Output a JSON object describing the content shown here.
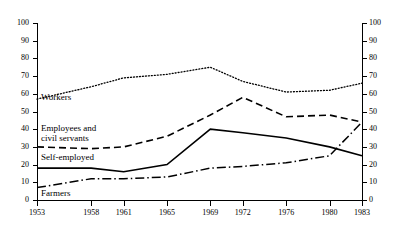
{
  "chart_data": {
    "type": "line",
    "title": "",
    "xlabel": "",
    "ylabel": "",
    "x": [
      1953,
      1958,
      1961,
      1965,
      1969,
      1972,
      1976,
      1980,
      1983
    ],
    "categories": [
      "1953",
      "1958",
      "1961",
      "1965",
      "1969",
      "1972",
      "1976",
      "1980",
      "1983"
    ],
    "xlim": [
      1953,
      1983
    ],
    "ylim": [
      0,
      100
    ],
    "ytick_step": 10,
    "yticks": [
      0,
      10,
      20,
      30,
      40,
      50,
      60,
      70,
      80,
      90,
      100
    ],
    "grid": false,
    "legend_position": "inline-left",
    "dual_y_axis": true,
    "series": [
      {
        "name": "Workers",
        "style": "dotted",
        "values": [
          57,
          64,
          69,
          71,
          75,
          67,
          61,
          62,
          66
        ]
      },
      {
        "name": "Employees and civil servants",
        "style": "dashed",
        "values": [
          30,
          29,
          30,
          36,
          48,
          58,
          47,
          48,
          44
        ]
      },
      {
        "name": "Self-employed",
        "style": "solid",
        "values": [
          18,
          18,
          16,
          20,
          40,
          38,
          35,
          30,
          25
        ]
      },
      {
        "name": "Farmers",
        "style": "dash-dot",
        "values": [
          7,
          12,
          12,
          13,
          18,
          19,
          21,
          25,
          44
        ]
      }
    ]
  },
  "axes": {
    "left_tick_labels": [
      "100",
      "90",
      "80",
      "70",
      "60",
      "50",
      "40",
      "30",
      "20",
      "10",
      "0"
    ],
    "right_tick_labels": [
      "100",
      "90",
      "80",
      "70",
      "60",
      "50",
      "40",
      "30",
      "20",
      "10",
      "0"
    ],
    "x_tick_labels": [
      "1953",
      "1958",
      "1961",
      "1965",
      "1969",
      "1972",
      "1976",
      "1980",
      "1983"
    ]
  },
  "series_labels": {
    "workers": "Workers",
    "employees_line1": "Employees and",
    "employees_line2": "civil servants",
    "self_employed": "Self-employed",
    "farmers": "Farmers"
  }
}
